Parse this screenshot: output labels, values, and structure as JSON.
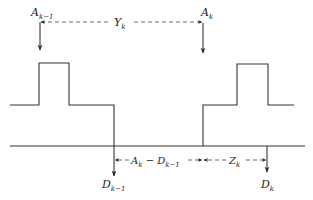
{
  "diagram": {
    "type": "timing-diagram",
    "labels": {
      "arrival_prev": {
        "base": "A",
        "sub": "k−1"
      },
      "arrival_curr": {
        "base": "A",
        "sub": "k"
      },
      "interarrival": {
        "base": "Y",
        "sub": "k"
      },
      "departure_prev": {
        "base": "D",
        "sub": "k−1"
      },
      "departure_curr": {
        "base": "D",
        "sub": "k"
      },
      "wait_gap": {
        "text_a": "A",
        "sub_a": "k",
        "minus": " − ",
        "text_b": "D",
        "sub_b": "k−1"
      },
      "service": {
        "base": "Z",
        "sub": "k"
      }
    },
    "colors": {
      "line": "#333333",
      "background": "#ffffff"
    }
  }
}
